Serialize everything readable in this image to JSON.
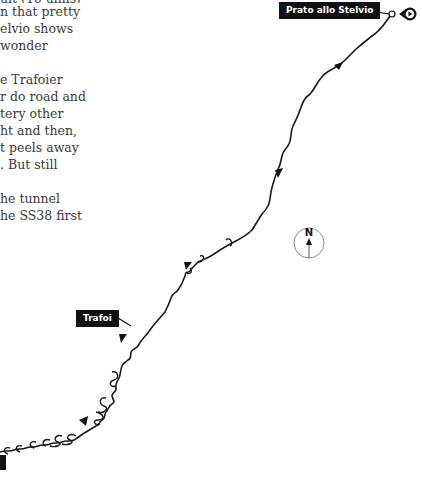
{
  "article": {
    "lines": [
      "ult (16 ulms)",
      "n that pretty",
      "elvio shows",
      "wonder",
      "",
      "e Trafoier",
      "r do road and",
      "tery other",
      "ht and then,",
      "t peels away",
      ". But still",
      "",
      "he tunnel",
      "he SS38 first"
    ]
  },
  "map": {
    "labels": {
      "start": "Prato allo Stelvio",
      "waypoint": "Trafoi"
    },
    "compass": {
      "letter": "N",
      "icon": "north-arrow-icon"
    },
    "start_marker_icon": "play-circle-icon",
    "route_color": "#1a1a1a",
    "label_bg": "#111111"
  }
}
